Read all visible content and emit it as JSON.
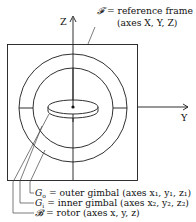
{
  "axes": {
    "z_label": "Z",
    "y_label": "Y"
  },
  "reference_frame": {
    "symbol": "𝓕",
    "equals": " = reference frame",
    "axes_text": "(axes X, Y, Z)"
  },
  "labels": [
    {
      "symbol": "G",
      "subscript": "o",
      "text": " = outer gimbal (axes x₁, y₁, z₁)"
    },
    {
      "symbol": "G",
      "subscript": "i",
      "text": " = inner gimbal (axes x₂, y₂, z₂)"
    },
    {
      "symbol": "𝓑",
      "subscript": "",
      "text": " = rotor (axes x, y, z)"
    }
  ]
}
